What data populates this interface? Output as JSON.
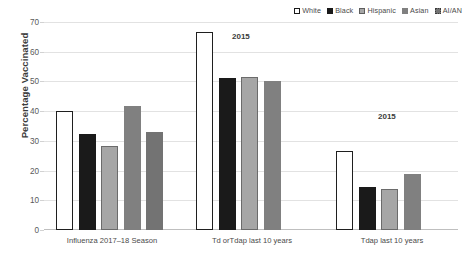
{
  "chart_data": {
    "type": "bar",
    "title": "",
    "xlabel": "",
    "ylabel": "Percentage Vaccinated",
    "ylim": [
      0,
      70
    ],
    "ytick_step": 10,
    "yticks": [
      0,
      10,
      20,
      30,
      40,
      50,
      60,
      70
    ],
    "grid": true,
    "legend_position": "top-right",
    "categories": [
      "Influenza 2017–18 Season",
      "Td orTdap  last 10 years",
      "Tdap last 10 years"
    ],
    "series": [
      {
        "name": "White",
        "color": "#ffffff",
        "values": [
          40.2,
          66.5,
          26.7
        ]
      },
      {
        "name": "Black",
        "color": "#1a1a1a",
        "values": [
          32.3,
          51.2,
          14.4
        ]
      },
      {
        "name": "Hispanic",
        "color": "#a6a6a6",
        "values": [
          28.3,
          51.4,
          13.8
        ]
      },
      {
        "name": "Asian",
        "color": "#808080",
        "values": [
          41.6,
          50.3,
          19.0
        ]
      },
      {
        "name": "AI/AN",
        "color": "#737373",
        "values": [
          33.0,
          null,
          null
        ]
      }
    ],
    "annotations": [
      {
        "text": "2015",
        "category": "Td orTdap  last 10 years"
      },
      {
        "text": "2015",
        "category": "Tdap last 10 years"
      }
    ]
  },
  "legend": {
    "items": [
      {
        "label": "White"
      },
      {
        "label": "Black"
      },
      {
        "label": "Hispanic"
      },
      {
        "label": "Asian"
      },
      {
        "label": "AI/AN"
      }
    ]
  },
  "axis": {
    "y_title": "Percentage Vaccinated",
    "y_ticks": [
      "70",
      "60",
      "50",
      "40",
      "30",
      "20",
      "10",
      "0"
    ]
  }
}
